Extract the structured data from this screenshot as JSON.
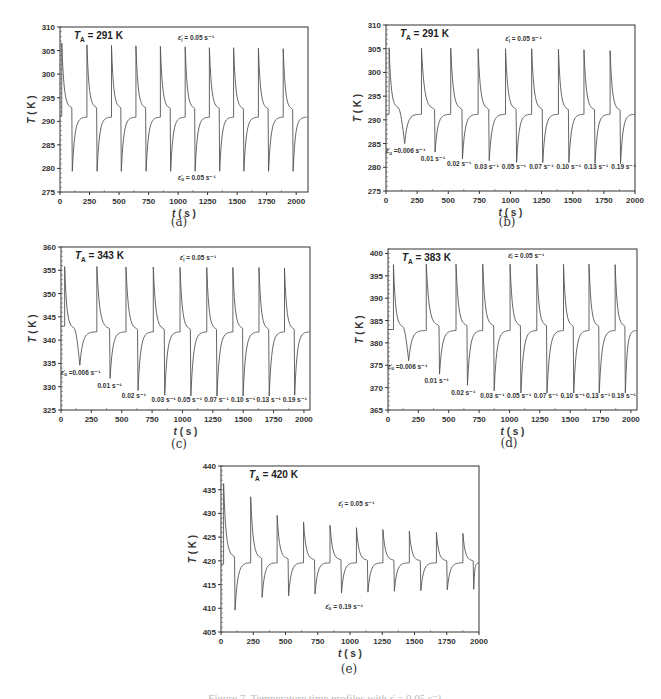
{
  "figure": {
    "caption": "Figure 7. Temperature time profiles with ε̇ = 0.05 s⁻¹ ...",
    "panels": [
      {
        "id": "a",
        "label": "(a)",
        "ta_label": "T",
        "ta_sub": "A",
        "ta_value": " = 291 K"
      },
      {
        "id": "b",
        "label": "(b)",
        "ta_label": "T",
        "ta_sub": "A",
        "ta_value": " = 291 K"
      },
      {
        "id": "c",
        "label": "(c)",
        "ta_label": "T",
        "ta_sub": "A",
        "ta_value": " = 343 K"
      },
      {
        "id": "d",
        "label": "(d)",
        "ta_label": "T",
        "ta_sub": "A",
        "ta_value": " = 383 K"
      },
      {
        "id": "e",
        "label": "(e)",
        "ta_label": "T",
        "ta_sub": "A",
        "ta_value": " = 420 K"
      }
    ]
  },
  "chart_data": [
    {
      "id": "a",
      "type": "line",
      "title": "T_A = 291 K",
      "xlabel": "t ( s )",
      "ylabel": "T ( K )",
      "xlim": [
        0,
        2100
      ],
      "ylim": [
        275,
        310
      ],
      "xticks": [
        0,
        250,
        500,
        750,
        1000,
        1250,
        1500,
        1750,
        2000
      ],
      "yticks": [
        275,
        280,
        285,
        290,
        295,
        300,
        305,
        310
      ],
      "frame": {
        "left": 60,
        "right": 308,
        "top": 27,
        "bottom": 192
      },
      "baseline": 290.9,
      "start": 291.2,
      "cycles": [
        {
          "t_load": 15,
          "peak": 306.6,
          "t_unload": 100,
          "pre": 292.8,
          "trough": 279.4
        },
        {
          "t_load": 228,
          "peak": 306.2,
          "t_unload": 310,
          "pre": 292.8,
          "trough": 279.4
        },
        {
          "t_load": 436,
          "peak": 306.1,
          "t_unload": 515,
          "pre": 292.8,
          "trough": 279.4
        },
        {
          "t_load": 643,
          "peak": 306.0,
          "t_unload": 725,
          "pre": 292.8,
          "trough": 279.4
        },
        {
          "t_load": 850,
          "peak": 305.9,
          "t_unload": 933,
          "pre": 292.7,
          "trough": 279.4
        },
        {
          "t_load": 1060,
          "peak": 305.8,
          "t_unload": 1140,
          "pre": 292.7,
          "trough": 279.4
        },
        {
          "t_load": 1265,
          "peak": 305.6,
          "t_unload": 1348,
          "pre": 292.7,
          "trough": 279.4
        },
        {
          "t_load": 1470,
          "peak": 305.6,
          "t_unload": 1553,
          "pre": 292.6,
          "trough": 279.4
        },
        {
          "t_load": 1680,
          "peak": 305.5,
          "t_unload": 1762,
          "pre": 292.6,
          "trough": 279.4
        },
        {
          "t_load": 1890,
          "peak": 305.4,
          "t_unload": 1970,
          "pre": 292.5,
          "trough": 279.4
        }
      ],
      "annotations": [
        {
          "text": "ε̇l = 0.05 s⁻¹",
          "x": 1000,
          "y": 307.2
        },
        {
          "text": "ε̇u = 0.05 s⁻¹",
          "x": 1000,
          "y": 277.6
        }
      ]
    },
    {
      "id": "b",
      "type": "line",
      "title": "T_A = 291 K",
      "xlabel": "t ( s )",
      "ylabel": "T ( K )",
      "xlim": [
        0,
        2000
      ],
      "ylim": [
        275,
        310
      ],
      "xticks": [
        0,
        250,
        500,
        750,
        1000,
        1250,
        1500,
        1750,
        2000
      ],
      "yticks": [
        275,
        280,
        285,
        290,
        295,
        300,
        305,
        310
      ],
      "frame": {
        "left": 386,
        "right": 635,
        "top": 25,
        "bottom": 191
      },
      "baseline": 291.2,
      "start": 291.2,
      "cycles": [
        {
          "t_load": 25,
          "peak": 305.2,
          "t_unload": 100,
          "pre": 292.5,
          "trough": 285.0,
          "t_trough": 150
        },
        {
          "t_load": 285,
          "peak": 305.1,
          "t_unload": 390,
          "pre": 292.2,
          "trough": 283.2
        },
        {
          "t_load": 520,
          "peak": 305.1,
          "t_unload": 610,
          "pre": 292.2,
          "trough": 281.8
        },
        {
          "t_load": 740,
          "peak": 305.0,
          "t_unload": 825,
          "pre": 292.2,
          "trough": 281.4
        },
        {
          "t_load": 960,
          "peak": 305.0,
          "t_unload": 1045,
          "pre": 292.2,
          "trough": 281.0
        },
        {
          "t_load": 1170,
          "peak": 305.0,
          "t_unload": 1255,
          "pre": 292.2,
          "trough": 281.0
        },
        {
          "t_load": 1385,
          "peak": 304.9,
          "t_unload": 1465,
          "pre": 292.1,
          "trough": 281.0
        },
        {
          "t_load": 1590,
          "peak": 304.8,
          "t_unload": 1675,
          "pre": 292.1,
          "trough": 280.8
        },
        {
          "t_load": 1800,
          "peak": 304.6,
          "t_unload": 1880,
          "pre": 292.0,
          "trough": 280.8
        }
      ],
      "annotations": [
        {
          "text": "ε̇l = 0.05 s⁻¹",
          "x": 960,
          "y": 306.6
        },
        {
          "text": "ε̇u =0.006 s⁻¹",
          "x": 0,
          "y": 283.0
        },
        {
          "text": "0.01 s⁻¹",
          "x": 280,
          "y": 281.4
        },
        {
          "text": "0.02 s⁻¹",
          "x": 490,
          "y": 280.3
        },
        {
          "text": "0.03 s⁻¹",
          "x": 710,
          "y": 279.6
        },
        {
          "text": "0.05 s⁻¹",
          "x": 930,
          "y": 279.6
        },
        {
          "text": "0.07 s⁻¹",
          "x": 1150,
          "y": 279.6
        },
        {
          "text": "0.10 s⁻¹",
          "x": 1370,
          "y": 279.6
        },
        {
          "text": "0.13 s⁻¹",
          "x": 1590,
          "y": 279.6
        },
        {
          "text": "0.19 s⁻¹",
          "x": 1810,
          "y": 279.6
        }
      ]
    },
    {
      "id": "c",
      "type": "line",
      "title": "T_A = 343 K",
      "xlabel": "t ( s )",
      "ylabel": "T ( K )",
      "xlim": [
        0,
        2050
      ],
      "ylim": [
        325,
        360
      ],
      "xticks": [
        0,
        250,
        500,
        750,
        1000,
        1250,
        1500,
        1750,
        2000
      ],
      "yticks": [
        325,
        330,
        335,
        340,
        345,
        350,
        355,
        360
      ],
      "frame": {
        "left": 61,
        "right": 310,
        "top": 247,
        "bottom": 410
      },
      "baseline": 341.8,
      "start": 343.0,
      "cycles": [
        {
          "t_load": 30,
          "peak": 355.8,
          "t_unload": 110,
          "pre": 342.5,
          "trough": 334.6,
          "t_trough": 155
        },
        {
          "t_load": 295,
          "peak": 355.8,
          "t_unload": 400,
          "pre": 342.4,
          "trough": 331.8
        },
        {
          "t_load": 535,
          "peak": 355.7,
          "t_unload": 630,
          "pre": 342.3,
          "trough": 329.2
        },
        {
          "t_load": 760,
          "peak": 355.7,
          "t_unload": 850,
          "pre": 342.3,
          "trough": 328.2
        },
        {
          "t_load": 980,
          "peak": 355.6,
          "t_unload": 1065,
          "pre": 342.3,
          "trough": 328.0
        },
        {
          "t_load": 1200,
          "peak": 355.6,
          "t_unload": 1280,
          "pre": 342.3,
          "trough": 328.0
        },
        {
          "t_load": 1415,
          "peak": 355.6,
          "t_unload": 1495,
          "pre": 342.5,
          "trough": 328.0
        },
        {
          "t_load": 1630,
          "peak": 355.6,
          "t_unload": 1710,
          "pre": 342.3,
          "trough": 328.0
        },
        {
          "t_load": 1840,
          "peak": 355.5,
          "t_unload": 1920,
          "pre": 342.3,
          "trough": 328.2
        }
      ],
      "annotations": [
        {
          "text": "ε̇l = 0.05 s⁻¹",
          "x": 980,
          "y": 357.2
        },
        {
          "text": "ε̇u =0.006 s⁻¹",
          "x": 0,
          "y": 332.6
        },
        {
          "text": "0.01 s⁻¹",
          "x": 300,
          "y": 329.8
        },
        {
          "text": "0.02 s⁻¹",
          "x": 500,
          "y": 327.6
        },
        {
          "text": "0.03 s⁻¹",
          "x": 745,
          "y": 326.8
        },
        {
          "text": "0.05 s⁻¹",
          "x": 960,
          "y": 326.8
        },
        {
          "text": "0.07 s⁻¹",
          "x": 1180,
          "y": 326.8
        },
        {
          "text": "0.10 s⁻¹",
          "x": 1400,
          "y": 326.8
        },
        {
          "text": "0.13 s⁻¹",
          "x": 1610,
          "y": 326.8
        },
        {
          "text": "0.19 s⁻¹",
          "x": 1825,
          "y": 326.8
        }
      ]
    },
    {
      "id": "d",
      "type": "line",
      "title": "T_A = 383 K",
      "xlabel": "t ( s )",
      "ylabel": "T ( K )",
      "xlim": [
        0,
        2050
      ],
      "ylim": [
        365,
        401
      ],
      "xticks": [
        0,
        250,
        500,
        750,
        1000,
        1250,
        1500,
        1750,
        2000
      ],
      "yticks": [
        365,
        370,
        375,
        380,
        385,
        390,
        395,
        400
      ],
      "frame": {
        "left": 388,
        "right": 637,
        "top": 249,
        "bottom": 410
      },
      "baseline": 382.8,
      "start": 383.0,
      "cycles": [
        {
          "t_load": 45,
          "peak": 397.5,
          "t_unload": 125,
          "pre": 383.5,
          "trough": 376.0,
          "t_trough": 170
        },
        {
          "t_load": 315,
          "peak": 397.6,
          "t_unload": 420,
          "pre": 383.8,
          "trough": 373.0
        },
        {
          "t_load": 560,
          "peak": 397.6,
          "t_unload": 650,
          "pre": 383.8,
          "trough": 370.5
        },
        {
          "t_load": 780,
          "peak": 397.6,
          "t_unload": 870,
          "pre": 383.8,
          "trough": 369.3
        },
        {
          "t_load": 1005,
          "peak": 397.6,
          "t_unload": 1090,
          "pre": 383.8,
          "trough": 368.8
        },
        {
          "t_load": 1225,
          "peak": 397.6,
          "t_unload": 1305,
          "pre": 383.8,
          "trough": 368.8
        },
        {
          "t_load": 1445,
          "peak": 397.6,
          "t_unload": 1525,
          "pre": 383.7,
          "trough": 368.8
        },
        {
          "t_load": 1655,
          "peak": 397.6,
          "t_unload": 1735,
          "pre": 383.7,
          "trough": 368.8
        },
        {
          "t_load": 1870,
          "peak": 397.5,
          "t_unload": 1950,
          "pre": 383.7,
          "trough": 368.8
        }
      ],
      "annotations": [
        {
          "text": "ε̇l = 0.05 s⁻¹",
          "x": 990,
          "y": 399.0
        },
        {
          "text": "ε̇u =0.006 s⁻¹",
          "x": 0,
          "y": 374.2
        },
        {
          "text": "0.01 s⁻¹",
          "x": 300,
          "y": 371.0
        },
        {
          "text": "0.02 s⁻¹",
          "x": 520,
          "y": 368.4
        },
        {
          "text": "0.03 s⁻¹",
          "x": 760,
          "y": 367.6
        },
        {
          "text": "0.05 s⁻¹",
          "x": 980,
          "y": 367.6
        },
        {
          "text": "0.07 s⁻¹",
          "x": 1200,
          "y": 367.6
        },
        {
          "text": "0.10 s⁻¹",
          "x": 1420,
          "y": 367.6
        },
        {
          "text": "0.13 s⁻¹",
          "x": 1630,
          "y": 367.6
        },
        {
          "text": "0.19 s⁻¹",
          "x": 1840,
          "y": 367.6
        }
      ]
    },
    {
      "id": "e",
      "type": "line",
      "title": "T_A = 420 K",
      "xlabel": "t ( s )",
      "ylabel": "T ( K )",
      "xlim": [
        0,
        2000
      ],
      "ylim": [
        405,
        440
      ],
      "xticks": [
        0,
        250,
        500,
        750,
        1000,
        1250,
        1500,
        1750,
        2000
      ],
      "yticks": [
        405,
        410,
        415,
        420,
        425,
        430,
        435,
        440
      ],
      "frame": {
        "left": 221,
        "right": 479,
        "top": 466,
        "bottom": 632
      },
      "baseline": 419.6,
      "start": 419.3,
      "cycles": [
        {
          "t_load": 20,
          "peak": 436.3,
          "t_unload": 105,
          "pre": 420.8,
          "trough": 409.6
        },
        {
          "t_load": 230,
          "peak": 433.5,
          "t_unload": 315,
          "pre": 420.5,
          "trough": 412.3
        },
        {
          "t_load": 435,
          "peak": 429.6,
          "t_unload": 520,
          "pre": 420.4,
          "trough": 412.6
        },
        {
          "t_load": 640,
          "peak": 428.2,
          "t_unload": 725,
          "pre": 420.2,
          "trough": 413.0
        },
        {
          "t_load": 845,
          "peak": 427.5,
          "t_unload": 930,
          "pre": 420.2,
          "trough": 413.2
        },
        {
          "t_load": 1050,
          "peak": 427.0,
          "t_unload": 1135,
          "pre": 420.1,
          "trough": 413.4
        },
        {
          "t_load": 1255,
          "peak": 426.6,
          "t_unload": 1340,
          "pre": 420.1,
          "trough": 413.6
        },
        {
          "t_load": 1460,
          "peak": 426.3,
          "t_unload": 1545,
          "pre": 420.0,
          "trough": 413.7
        },
        {
          "t_load": 1670,
          "peak": 426.0,
          "t_unload": 1750,
          "pre": 420.0,
          "trough": 413.9
        },
        {
          "t_load": 1875,
          "peak": 425.8,
          "t_unload": 1955,
          "pre": 420.0,
          "trough": 414.0
        }
      ],
      "annotations": [
        {
          "text": "ε̇l = 0.05 s⁻¹",
          "x": 910,
          "y": 431.5
        },
        {
          "text": "ε̇u = 0.19 s⁻¹",
          "x": 810,
          "y": 409.9
        }
      ]
    }
  ]
}
